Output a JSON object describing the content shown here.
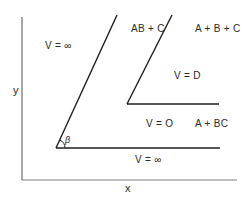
{
  "axes": {
    "x_label": "x",
    "y_label": "y"
  },
  "regions": {
    "top_left": "V = ∞",
    "middle": "V = D",
    "lower_middle": "V = O",
    "bottom": "V = ∞"
  },
  "species": {
    "ab_c": "AB + C",
    "a_b_c": "A + B + C",
    "a_bc": "A + BC"
  },
  "angle": {
    "label": "β"
  },
  "colors": {
    "line": "#1e1e1e",
    "axis": "#6a6a6a",
    "text": "#2a2a2a"
  }
}
